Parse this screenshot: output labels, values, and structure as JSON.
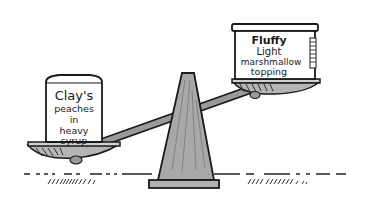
{
  "illustration": {
    "description": "Hand-drawn balance scale comparing two cans",
    "left_can": {
      "lines": [
        "Clay's",
        "peaches",
        "in",
        "heavy",
        "syrup"
      ],
      "position": "low (heavier)"
    },
    "right_can": {
      "lines": [
        "Fluffy",
        "Light",
        "marshmallow",
        "topping"
      ],
      "position": "high (lighter)"
    },
    "colors": {
      "ink": "#1a1a1a",
      "fulcrum_fill": "#a8a8a8",
      "pan_fill": "#b5b5b5",
      "paper": "#fefefe"
    }
  }
}
